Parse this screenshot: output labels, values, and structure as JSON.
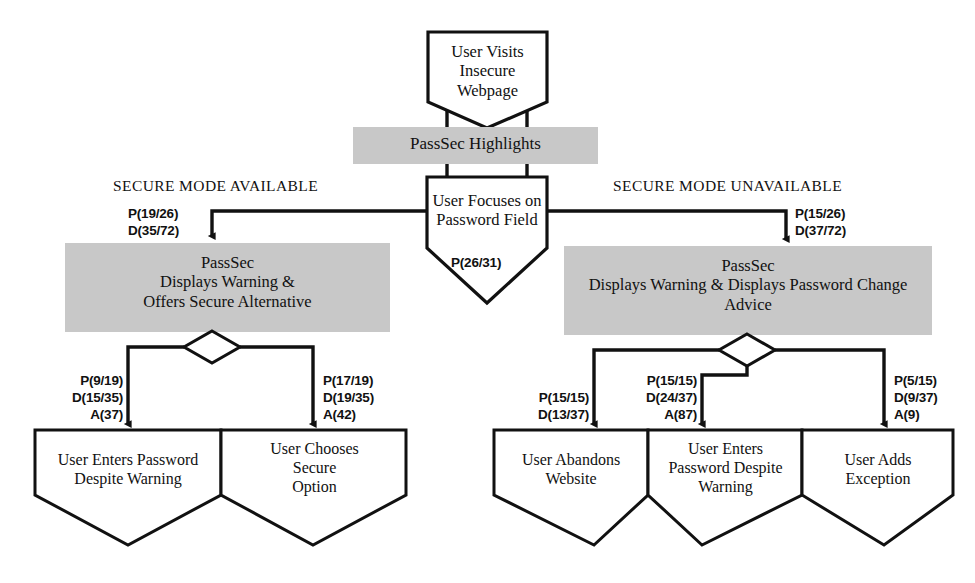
{
  "diagram": {
    "colors": {
      "node_fill_gray": "#c8c8c8",
      "node_fill_white": "#ffffff",
      "stroke": "#111111",
      "background": "#ffffff"
    },
    "nodes": {
      "start": {
        "label": "User Visits\nInsecure\nWebpage",
        "shape": "pentagon-down"
      },
      "highlights": {
        "label": "PassSec Highlights",
        "shape": "rectangle",
        "fill": "gray"
      },
      "focus": {
        "label": "User Focuses on\nPassword Field",
        "shape": "pentagon-down"
      },
      "secure_available": {
        "label": "PassSec\nDisplays Warning &\nOffers Secure Alternative",
        "shape": "rectangle",
        "fill": "gray"
      },
      "secure_unavailable": {
        "label": "PassSec\nDisplays Warning & Displays Password Change\nAdvice",
        "shape": "rectangle",
        "fill": "gray"
      },
      "leaf_enter_despite_left": {
        "label": "User Enters Password\nDespite Warning",
        "shape": "pentagon-down"
      },
      "leaf_choose_secure": {
        "label": "User Chooses\nSecure\nOption",
        "shape": "pentagon-down"
      },
      "leaf_abandon": {
        "label": "User Abandons\nWebsite",
        "shape": "pentagon-down"
      },
      "leaf_enter_despite_right": {
        "label": "User Enters\nPassword Despite\nWarning",
        "shape": "pentagon-down"
      },
      "leaf_add_exception": {
        "label": "User Adds\nException",
        "shape": "pentagon-down"
      }
    },
    "branch_labels": {
      "left": "SECURE MODE AVAILABLE",
      "right": "SECURE MODE UNAVAILABLE"
    },
    "edge_labels": {
      "focus_self": "P(26/31)",
      "to_secure_available": "P(19/26)\nD(35/72)",
      "to_secure_unavailable": "P(15/26)\nD(37/72)",
      "to_enter_despite_left": "P(9/19)\nD(15/35)\nA(37)",
      "to_choose_secure": "P(17/19)\nD(19/35)\nA(42)",
      "to_abandon": "P(15/15)\nD(13/37)",
      "to_enter_despite_right": "P(15/15)\nD(24/37)\nA(87)",
      "to_add_exception": "P(5/15)\nD(9/37)\nA(9)"
    }
  }
}
